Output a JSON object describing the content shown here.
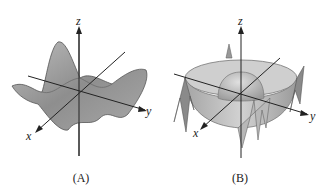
{
  "figure": {
    "panels": [
      {
        "id": "A",
        "caption": "(A)",
        "description": "Wavy 3D surface with multiple peaks and valleys",
        "axes": {
          "x": "x",
          "y": "y",
          "z": "z"
        }
      },
      {
        "id": "B",
        "caption": "(B)",
        "description": "Radially symmetric 3D surface: central dome surrounded by ring-shaped trough with oscillating outer rim",
        "axes": {
          "x": "x",
          "y": "y",
          "z": "z"
        }
      }
    ],
    "colors": {
      "surface": "#9a9a9a",
      "surface_light": "#c8c8c8",
      "axis": "#222222",
      "background": "#ffffff"
    }
  }
}
